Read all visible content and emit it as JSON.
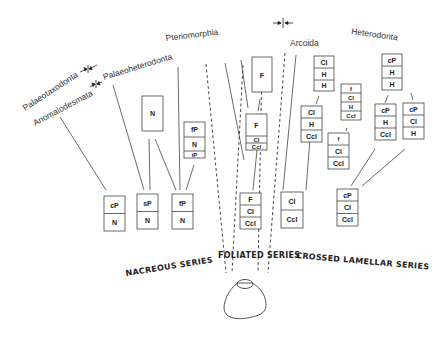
{
  "clades": {
    "palaeotaxodonta": "Palaeotaxodonta",
    "anomalodesmata": "Anomalodesmata",
    "palaeoheterodonta": "Palaeoheterodonta",
    "pteriomorphia": "Pteriomorphia",
    "arcoida": "Arcoida",
    "heterodonta": "Heterodonta"
  },
  "series": {
    "nacreous": "NACREOUS SERIES",
    "foliated": "FOLIATED SERIES",
    "crossed_lamellar": "CROSSED LAMELLAR SERIES"
  },
  "boxes": {
    "nacr_cP_N": [
      "cP",
      "N"
    ],
    "nacr_sP_N": [
      "sP",
      "N"
    ],
    "nacr_fP_N": [
      "fP",
      "N"
    ],
    "palaeohet_N": [
      "N"
    ],
    "pterio_fP_N_iP": [
      "fP",
      "N",
      "iP"
    ],
    "fol_F_top": [
      "F"
    ],
    "fol_F_Cl_Ccl_mid": [
      "F",
      "Cl",
      "Ccl"
    ],
    "fol_F_Cl_Ccl_bottom": [
      "F",
      "Cl",
      "Ccl"
    ],
    "arc_Cl_H_H": [
      "Cl",
      "H",
      "H"
    ],
    "arc_Cl_H_Ccl": [
      "Cl",
      "H",
      "Ccl"
    ],
    "arc_Cl_Ccl": [
      "Cl",
      "Ccl"
    ],
    "het_f_Cl_H_Ccl": [
      "f",
      "Cl",
      "H",
      "Ccl"
    ],
    "het_f_Cl_Ccl": [
      "f",
      "Cl",
      "Ccl"
    ],
    "het_cP_H_H": [
      "cP",
      "H",
      "H"
    ],
    "het_cP_H_Ccl": [
      "cP",
      "H",
      "Ccl"
    ],
    "het_cP_Cl_H": [
      "cP",
      "Cl",
      "H"
    ],
    "het_cP_Cl_Ccl": [
      "cP",
      "Cl",
      "Ccl"
    ]
  },
  "icons": {
    "boundary_markers": "arrow-pair-icon",
    "shell": "shell-outline-icon"
  },
  "colors": {
    "ink": "#222222",
    "background": "#ffffff"
  }
}
